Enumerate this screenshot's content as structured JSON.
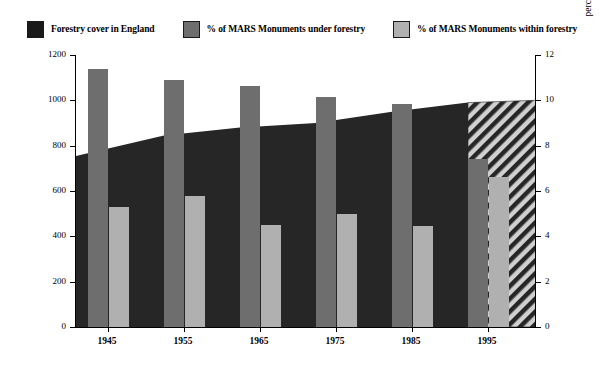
{
  "legend": {
    "items": [
      {
        "label": "Forestry cover in England",
        "color": "#1a1a1a",
        "name": "legend-forestry-cover"
      },
      {
        "label": "% of MARS Monuments under forestry",
        "color": "#6e6e6e",
        "name": "legend-under-forestry"
      },
      {
        "label": "% of MARS Monuments within forestry",
        "color": "#b0b0b0",
        "name": "legend-within-forestry"
      }
    ]
  },
  "axes": {
    "left": {
      "title": "ha under forestry in England ('000's)",
      "ticks": [
        "0",
        "200",
        "400",
        "600",
        "800",
        "1000",
        "1200"
      ],
      "min": 0,
      "max": 1200
    },
    "right": {
      "title": "percentage MARS Monuments under and within forestry",
      "ticks": [
        "0",
        "2",
        "4",
        "6",
        "8",
        "10",
        "12"
      ],
      "min": 0,
      "max": 12
    },
    "x": {
      "ticks": [
        "1945",
        "1955",
        "1965",
        "1975",
        "1985",
        "1995"
      ]
    }
  },
  "chart_data": {
    "type": "bar",
    "title": "",
    "xlabel": "",
    "ylabel": "ha under forestry in England ('000's)",
    "ylabel_secondary": "percentage MARS Monuments under and within forestry",
    "ylim": [
      0,
      1200
    ],
    "ylim_secondary": [
      0,
      12
    ],
    "grid": false,
    "legend_position": "top",
    "categories": [
      "1945",
      "1955",
      "1965",
      "1975",
      "1985",
      "1995"
    ],
    "series": [
      {
        "name": "% of MARS Monuments under forestry",
        "type": "bar",
        "axis": "right",
        "color": "#6e6e6e",
        "values": [
          11.4,
          10.9,
          10.65,
          10.15,
          9.85,
          7.4
        ]
      },
      {
        "name": "% of MARS Monuments within forestry",
        "type": "bar",
        "axis": "right",
        "color": "#b0b0b0",
        "values": [
          5.3,
          5.8,
          4.5,
          5.0,
          4.45,
          6.6
        ]
      },
      {
        "name": "Forestry cover in England",
        "type": "area",
        "axis": "left",
        "color": "#1a1a1a",
        "x": [
          1945,
          1955,
          1965,
          1975,
          1985,
          1995,
          1999
        ],
        "values": [
          755,
          845,
          880,
          900,
          950,
          990,
          1000
        ],
        "note": "final segment drawn with diagonal hatch (projected)"
      }
    ]
  }
}
